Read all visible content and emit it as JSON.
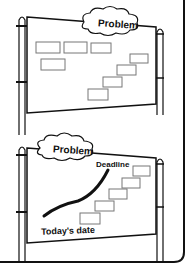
{
  "top_board": {
    "cloud_label": "Problem",
    "sticky_notes_count": 8
  },
  "bottom_board": {
    "cloud_label": "Problem",
    "deadline_label": "Deadline",
    "today_label": "Today's date",
    "sticky_notes_count": 5
  },
  "colors": {
    "line": "#111111",
    "note_border": "#777777",
    "background": "#ffffff"
  }
}
